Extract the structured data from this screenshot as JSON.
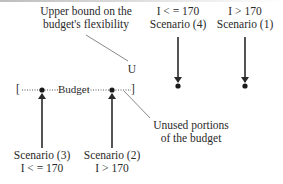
{
  "diagram": {
    "upper_bound_note": {
      "line1": "Upper bound on the",
      "line2": "budget's flexibility"
    },
    "upper_bound_marker": "U",
    "budget_bar": {
      "left_bracket": "[",
      "label": "Budget",
      "right_bracket": "]"
    },
    "unused_note": {
      "line1": "Unused portions",
      "line2": "of the budget"
    },
    "scenarios": [
      {
        "id": "scenario-4",
        "name": "Scenario (4)",
        "condition": "I < = 170",
        "position": "top"
      },
      {
        "id": "scenario-1",
        "name": "Scenario (1)",
        "condition": "I > 170",
        "position": "top"
      },
      {
        "id": "scenario-3",
        "name": "Scenario (3)",
        "condition": "I < = 170",
        "position": "bottom"
      },
      {
        "id": "scenario-2",
        "name": "Scenario (2)",
        "condition": "I > 170",
        "position": "bottom"
      }
    ],
    "colors": {
      "ink": "#2a2a2a",
      "leader": "#6b6b6b",
      "background": "#ffffff"
    }
  }
}
